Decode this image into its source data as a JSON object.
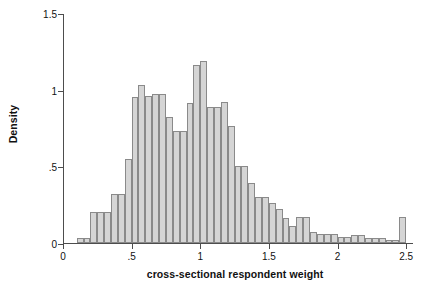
{
  "chart_data": {
    "type": "bar",
    "title": "",
    "subtitle": "",
    "xlabel": "cross-sectional respondent weight",
    "ylabel": "Density",
    "xlim": [
      0,
      2.55
    ],
    "ylim": [
      0,
      1.5
    ],
    "grid": false,
    "legend": null,
    "bin_width": 0.05,
    "xticks": [
      {
        "value": 0,
        "label": "0"
      },
      {
        "value": 0.5,
        "label": ".5"
      },
      {
        "value": 1,
        "label": "1"
      },
      {
        "value": 1.5,
        "label": "1.5"
      },
      {
        "value": 2,
        "label": "2"
      },
      {
        "value": 2.5,
        "label": "2.5"
      }
    ],
    "yticks": [
      {
        "value": 0,
        "label": "0"
      },
      {
        "value": 0.5,
        "label": ".5"
      },
      {
        "value": 1,
        "label": "1"
      },
      {
        "value": 1.5,
        "label": "1.5"
      }
    ],
    "bin_starts": [
      0.1,
      0.15,
      0.2,
      0.25,
      0.3,
      0.35,
      0.4,
      0.45,
      0.5,
      0.55,
      0.6,
      0.65,
      0.7,
      0.75,
      0.8,
      0.85,
      0.9,
      0.95,
      1.0,
      1.05,
      1.1,
      1.15,
      1.2,
      1.25,
      1.3,
      1.35,
      1.4,
      1.45,
      1.5,
      1.55,
      1.6,
      1.65,
      1.7,
      1.75,
      1.8,
      1.85,
      1.9,
      1.95,
      2.0,
      2.05,
      2.1,
      2.15,
      2.2,
      2.25,
      2.3,
      2.35,
      2.4,
      2.45
    ],
    "categories": [
      "0.10",
      "0.15",
      "0.20",
      "0.25",
      "0.30",
      "0.35",
      "0.40",
      "0.45",
      "0.50",
      "0.55",
      "0.60",
      "0.65",
      "0.70",
      "0.75",
      "0.80",
      "0.85",
      "0.90",
      "0.95",
      "1.00",
      "1.05",
      "1.10",
      "1.15",
      "1.20",
      "1.25",
      "1.30",
      "1.35",
      "1.40",
      "1.45",
      "1.50",
      "1.55",
      "1.60",
      "1.65",
      "1.70",
      "1.75",
      "1.80",
      "1.85",
      "1.90",
      "1.95",
      "2.00",
      "2.05",
      "2.10",
      "2.15",
      "2.20",
      "2.25",
      "2.30",
      "2.35",
      "2.40",
      "2.45"
    ],
    "values": [
      0.03,
      0.03,
      0.2,
      0.2,
      0.2,
      0.32,
      0.32,
      0.55,
      0.95,
      1.03,
      0.96,
      0.97,
      0.97,
      0.82,
      0.73,
      0.73,
      0.91,
      1.16,
      1.19,
      0.89,
      0.89,
      0.92,
      0.76,
      0.5,
      0.5,
      0.39,
      0.3,
      0.3,
      0.26,
      0.22,
      0.16,
      0.11,
      0.17,
      0.17,
      0.07,
      0.06,
      0.06,
      0.06,
      0.04,
      0.04,
      0.05,
      0.05,
      0.03,
      0.03,
      0.03,
      0.02,
      0.02,
      0.17
    ],
    "colors": {
      "bar_fill": "#d5d5d5",
      "bar_edge": "#8a8a8a",
      "axis": "#4d4d4d",
      "text": "#111111",
      "background": "#ffffff"
    }
  }
}
